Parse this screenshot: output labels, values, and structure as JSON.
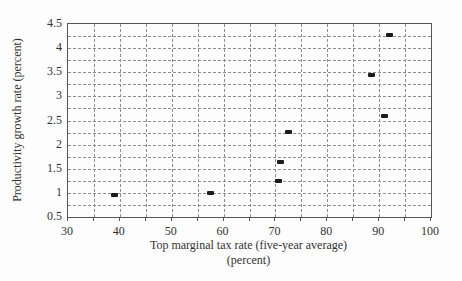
{
  "figure": {
    "background": "#fdfdfd",
    "frame_color": "#565656",
    "grid_color": "#8e8e8e",
    "text_color": "#333333",
    "marker_color": "#1c1c1c"
  },
  "chart_data": {
    "type": "scatter",
    "title": "",
    "xlabel": "Top marginal tax rate (five-year average)",
    "xlabel_line2": "(percent)",
    "ylabel": "Productivity growth rate (percent)",
    "xlim": [
      30,
      100
    ],
    "ylim": [
      0.5,
      4.5
    ],
    "x_ticks": [
      30,
      40,
      50,
      60,
      70,
      80,
      90,
      100
    ],
    "y_ticks": [
      4.5,
      4,
      3.5,
      3,
      2.5,
      2,
      1.5,
      1,
      0.5
    ],
    "x_grid_interval": 5,
    "y_grid_interval": 0.25,
    "grid_style": "dashed",
    "legend": null,
    "marker_shape": "filled-rectangle",
    "points": [
      {
        "x": 39,
        "y": 0.95
      },
      {
        "x": 57.5,
        "y": 1.0
      },
      {
        "x": 70.5,
        "y": 1.25
      },
      {
        "x": 71,
        "y": 1.65
      },
      {
        "x": 72.5,
        "y": 2.27
      },
      {
        "x": 88.5,
        "y": 3.45
      },
      {
        "x": 91,
        "y": 2.6
      },
      {
        "x": 92,
        "y": 4.27
      }
    ]
  }
}
